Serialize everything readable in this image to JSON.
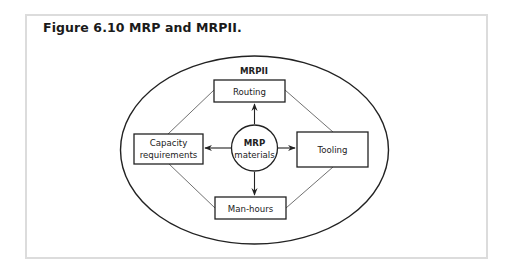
{
  "figure": {
    "title": "Figure 6.10 MRP and MRPII."
  },
  "diagram": {
    "outer_label": "MRPII",
    "center": {
      "line1": "MRP",
      "line2": "materials"
    },
    "nodes": {
      "top": {
        "label": "Routing"
      },
      "left": {
        "line1": "Capacity",
        "line2": "requirements"
      },
      "right": {
        "label": "Tooling"
      },
      "bottom": {
        "label": "Man-hours"
      }
    },
    "colors": {
      "stroke": "#222222",
      "frame_border": "#dcdcdc",
      "background": "#ffffff"
    }
  }
}
